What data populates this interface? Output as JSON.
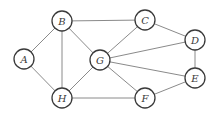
{
  "graph": {
    "nodes": [
      {
        "id": "A",
        "label": "A",
        "x": 24,
        "y": 59
      },
      {
        "id": "B",
        "label": "B",
        "x": 62,
        "y": 21
      },
      {
        "id": "G",
        "label": "G",
        "x": 100,
        "y": 60
      },
      {
        "id": "H",
        "label": "H",
        "x": 62,
        "y": 98
      },
      {
        "id": "C",
        "label": "C",
        "x": 145,
        "y": 20
      },
      {
        "id": "D",
        "label": "D",
        "x": 195,
        "y": 40
      },
      {
        "id": "E",
        "label": "E",
        "x": 195,
        "y": 78
      },
      {
        "id": "F",
        "label": "F",
        "x": 145,
        "y": 98
      }
    ],
    "edges": [
      [
        "A",
        "B"
      ],
      [
        "A",
        "H"
      ],
      [
        "B",
        "H"
      ],
      [
        "B",
        "G"
      ],
      [
        "B",
        "C"
      ],
      [
        "G",
        "H"
      ],
      [
        "G",
        "C"
      ],
      [
        "G",
        "D"
      ],
      [
        "G",
        "E"
      ],
      [
        "G",
        "F"
      ],
      [
        "H",
        "F"
      ],
      [
        "C",
        "D"
      ],
      [
        "D",
        "E"
      ],
      [
        "E",
        "F"
      ]
    ],
    "node_radius": 10,
    "colors": {
      "edge": "#8a8a8a",
      "node_stroke": "#3a3a3a",
      "node_fill": "#ffffff"
    }
  }
}
